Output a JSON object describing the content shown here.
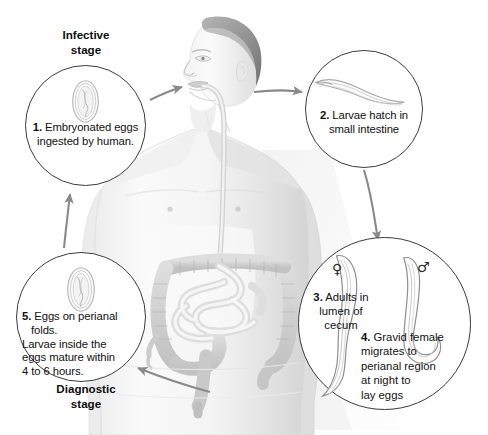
{
  "figure": {
    "canvas": {
      "width": 488,
      "height": 435,
      "background": "#ffffff"
    },
    "line_color": "#3b3b3b",
    "text_color": "#111111",
    "illustration_gray": "#d9dadb"
  },
  "labels": {
    "infective_stage": "Infective\nstage",
    "infective_stage_line1": "Infective",
    "infective_stage_line2": "stage",
    "diagnostic_stage_line1": "Diagnostic",
    "diagnostic_stage_line2": "stage"
  },
  "callouts": [
    {
      "id": "c1",
      "number": "1.",
      "text": "Embryonated eggs ingested by human.",
      "lines": [
        "Embryonated eggs",
        "ingested by human."
      ],
      "art": "pinworm-egg",
      "stage_label": "Infective stage"
    },
    {
      "id": "c2",
      "number": "2.",
      "text": "Larvae hatch in small intestine",
      "lines": [
        "Larvae hatch in",
        "small intestine"
      ],
      "art": "larva"
    },
    {
      "id": "c3",
      "number": "3.",
      "text": "Adults in lumen of cecum",
      "lines": [
        "Adults in",
        "lumen of",
        "cecum"
      ],
      "art": "female-worm",
      "symbol": "♀"
    },
    {
      "id": "c4",
      "number": "4.",
      "text": "Gravid female migrates to perianal region at night to lay eggs",
      "lines": [
        "Gravid female",
        "migrates to",
        "perianal region",
        "at night to",
        "lay eggs"
      ],
      "art": "male-worm",
      "symbol": "♂"
    },
    {
      "id": "c5",
      "number": "5.",
      "text": "Eggs on perianal folds. Larvae inside the eggs mature within 4 to 6 hours.",
      "lines": [
        "Eggs on perianal folds.",
        "Larvae inside the",
        "eggs mature within",
        "4 to 6 hours."
      ],
      "art": "pinworm-egg",
      "stage_label": "Diagnostic stage"
    }
  ],
  "arrows": [
    {
      "name": "arrow-mouth-ingestion",
      "from": "callout-1",
      "to": "mouth",
      "direction": "right"
    },
    {
      "name": "arrow-head-to-callout-2",
      "from": "head",
      "to": "callout-2",
      "direction": "right"
    },
    {
      "name": "arrow-callout-2-to-callout-34",
      "from": "callout-2",
      "to": "callout-34",
      "direction": "down"
    },
    {
      "name": "arrow-perianal-to-callout-5",
      "from": "perianal-region",
      "to": "callout-5",
      "direction": "left"
    },
    {
      "name": "arrow-callout-5-to-callout-1",
      "from": "callout-5",
      "to": "callout-1",
      "direction": "up"
    }
  ],
  "anatomy": [
    {
      "name": "human-male-torso",
      "description": "grayscale male figure, head in profile facing left"
    },
    {
      "name": "esophagus",
      "description": "tube from mouth down to intestines"
    },
    {
      "name": "large-intestine-colon"
    },
    {
      "name": "small-intestine"
    },
    {
      "name": "cecum"
    },
    {
      "name": "rectum"
    }
  ]
}
